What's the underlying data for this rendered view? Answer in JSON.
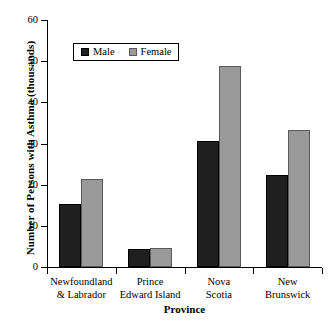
{
  "chart_data": {
    "type": "bar",
    "title": "",
    "xlabel": "Province",
    "ylabel": "Number of Persons with Asthma (thousands)",
    "categories": [
      "Newfoundland & Labrador",
      "Prince Edward Island",
      "Nova Scotia",
      "New Brunswick"
    ],
    "category_lines": [
      [
        "Newfoundland",
        "& Labrador"
      ],
      [
        "Prince",
        "Edward Island"
      ],
      [
        "Nova",
        "Scotia"
      ],
      [
        "New",
        "Brunswick"
      ]
    ],
    "series": [
      {
        "name": "Male",
        "color": "#1f1f1f",
        "values": [
          15.3,
          4.4,
          30.6,
          22.3
        ]
      },
      {
        "name": "Female",
        "color": "#9a9a9a",
        "values": [
          21.4,
          4.5,
          48.8,
          33.2
        ]
      }
    ],
    "ylim": [
      0,
      60
    ],
    "yticks": [
      0,
      10,
      20,
      30,
      40,
      50,
      60
    ],
    "ytick_labels": [
      "0",
      "10",
      "20",
      "30",
      "40",
      "50",
      "60"
    ],
    "grid": false,
    "legend_position": "upper-left-inside"
  },
  "legend": {
    "items": [
      {
        "label": "Male"
      },
      {
        "label": "Female"
      }
    ]
  },
  "axes": {
    "y_title": "Number of Persons with Asthma (thousands)",
    "x_title": "Province"
  }
}
